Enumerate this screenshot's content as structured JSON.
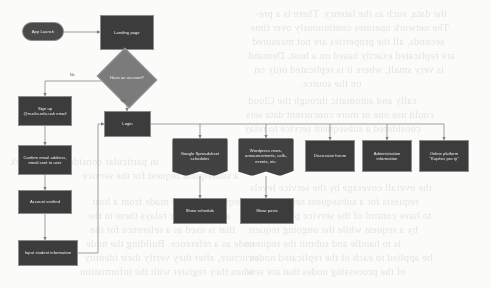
{
  "diagram": {
    "background_color": "#fbfbfa",
    "node_fill": "#3c3c3c",
    "decision_fill": "#7b7b7b",
    "edge_color": "#8f8f8f",
    "nodes": [
      {
        "id": "app-launch",
        "label": "App Launch",
        "shape": "terminator"
      },
      {
        "id": "landing-page",
        "label": "Landing page",
        "shape": "process"
      },
      {
        "id": "have-account",
        "label": "Have an account?",
        "shape": "decision"
      },
      {
        "id": "sign-up",
        "label": "Sign up @nuclio.edu.uah email",
        "shape": "process"
      },
      {
        "id": "confirm-email",
        "label": "Confirm email address, email sent to user",
        "shape": "process"
      },
      {
        "id": "account-verified",
        "label": "Account verified",
        "shape": "process"
      },
      {
        "id": "input-student",
        "label": "Input student information",
        "shape": "process"
      },
      {
        "id": "login",
        "label": "Login",
        "shape": "process"
      },
      {
        "id": "spreadsheet",
        "label": "Google Spreadsheet schedules",
        "shape": "document"
      },
      {
        "id": "wordpress",
        "label": "Wordpress news, announcements, calls, events, etc.",
        "shape": "document"
      },
      {
        "id": "discussion-forum",
        "label": "Discussion forum",
        "shape": "process"
      },
      {
        "id": "administration",
        "label": "Administration information",
        "shape": "process"
      },
      {
        "id": "online-platform",
        "label": "Online platform \"Kupérci pro ty\"",
        "shape": "process"
      },
      {
        "id": "show-schedule",
        "label": "Show schedule",
        "shape": "process"
      },
      {
        "id": "show-posts",
        "label": "Show posts",
        "shape": "process"
      }
    ],
    "edge_labels": {
      "no": "No",
      "yes": "Yes"
    }
  },
  "background_text": {
    "lines": [
      "the data, such as the latency. There is a pre-",
      "The network operates continuously over time",
      "seconds, all the properties are not measured",
      "are replicated exactly based on a host. Demand",
      "is very small, where it is replicated only on",
      "on the source.",
      "cally and automatic through the Cloud",
      "could use one or more concurrent data sets",
      "considered a subsequent service to relay",
      "the overall coverage by the service levels",
      "requests for a subsequent service to the",
      "to have control of the service parameters",
      "by a request while the ongoing request",
      "is to handle and submit the requests",
      "be applied to each of the replicated nodes",
      "of the processing nodes that are sent",
      "in particular consider the network",
      "a subsequent request for the service",
      "requests that are made from a host",
      "and the server relays them to the",
      "that is used as a reference for the",
      "node as a reference. Building the node",
      "structure, after they verify their identity",
      "when they register with the information"
    ]
  }
}
